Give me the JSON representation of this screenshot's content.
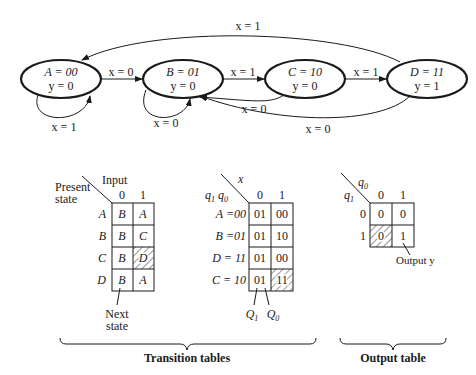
{
  "state_diagram": {
    "states": [
      {
        "id": "A",
        "code": "A = 00",
        "output": "y = 0"
      },
      {
        "id": "B",
        "code": "B = 01",
        "output": "y = 0"
      },
      {
        "id": "C",
        "code": "C = 10",
        "output": "y = 0"
      },
      {
        "id": "D",
        "code": "D = 11",
        "output": "y = 1"
      }
    ],
    "transitions": [
      {
        "from": "A",
        "to": "A",
        "label": "x = 1"
      },
      {
        "from": "A",
        "to": "B",
        "label": "x = 0"
      },
      {
        "from": "B",
        "to": "B",
        "label": "x = 0"
      },
      {
        "from": "B",
        "to": "C",
        "label": "x = 1"
      },
      {
        "from": "C",
        "to": "D",
        "label": "x = 1"
      },
      {
        "from": "C",
        "to": "B",
        "label": "x = 0"
      },
      {
        "from": "D",
        "to": "B",
        "label": "x = 0"
      },
      {
        "from": "D",
        "to": "A",
        "label": "x = 1"
      }
    ]
  },
  "table1": {
    "row_header": "Present",
    "row_header2": "state",
    "col_header": "Input",
    "cols": [
      "0",
      "1"
    ],
    "rows": [
      {
        "state": "A",
        "cells": [
          "B",
          "A"
        ]
      },
      {
        "state": "B",
        "cells": [
          "B",
          "C"
        ]
      },
      {
        "state": "C",
        "cells": [
          "B",
          "D"
        ]
      },
      {
        "state": "D",
        "cells": [
          "B",
          "A"
        ]
      }
    ],
    "note1": "Next",
    "note2": "state"
  },
  "table2": {
    "col_var": "x",
    "row_var": "q1 q0",
    "cols": [
      "0",
      "1"
    ],
    "rows": [
      {
        "state": "A =00",
        "cells": [
          "01",
          "00"
        ]
      },
      {
        "state": "B =01",
        "cells": [
          "01",
          "10"
        ]
      },
      {
        "state": "D = 11",
        "cells": [
          "01",
          "00"
        ]
      },
      {
        "state": "C = 10",
        "cells": [
          "01",
          "11"
        ]
      }
    ],
    "q1_label": "Q1",
    "q0_label": "Q0"
  },
  "table3": {
    "col_var": "q0",
    "row_var": "q1",
    "cols": [
      "0",
      "1"
    ],
    "rows": [
      {
        "state": "0",
        "cells": [
          "0",
          "0"
        ]
      },
      {
        "state": "1",
        "cells": [
          "0",
          "1"
        ]
      }
    ],
    "note": "Output y"
  },
  "captions": {
    "transition": "Transition tables",
    "output": "Output table"
  }
}
